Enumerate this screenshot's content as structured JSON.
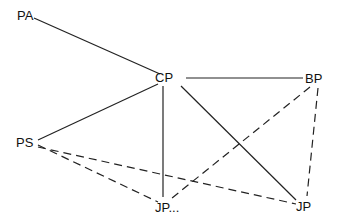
{
  "diagram": {
    "type": "network-graph",
    "nodes": [
      {
        "id": "PA",
        "label": "PA",
        "x": 30,
        "y": 14
      },
      {
        "id": "CP",
        "label": "CP",
        "x": 170,
        "y": 77
      },
      {
        "id": "BP",
        "label": "BP",
        "x": 318,
        "y": 78
      },
      {
        "id": "PS",
        "label": "PS",
        "x": 26,
        "y": 142
      },
      {
        "id": "JP1",
        "label": "JP...",
        "x": 175,
        "y": 209
      },
      {
        "id": "JP2",
        "label": "JP",
        "x": 310,
        "y": 206
      }
    ],
    "edges": [
      {
        "from": "PA",
        "to": "CP",
        "style": "solid"
      },
      {
        "from": "CP",
        "to": "BP",
        "style": "solid"
      },
      {
        "from": "CP",
        "to": "PS",
        "style": "solid"
      },
      {
        "from": "CP",
        "to": "JP1",
        "style": "solid"
      },
      {
        "from": "CP",
        "to": "JP2",
        "style": "solid"
      },
      {
        "from": "PS",
        "to": "JP1",
        "style": "dashed"
      },
      {
        "from": "PS",
        "to": "JP2",
        "style": "dashed"
      },
      {
        "from": "BP",
        "to": "JP1",
        "style": "dashed"
      },
      {
        "from": "BP",
        "to": "JP2",
        "style": "dashed"
      }
    ],
    "colors": {
      "line": "#222222",
      "text": "#111111",
      "background": "#ffffff"
    }
  }
}
